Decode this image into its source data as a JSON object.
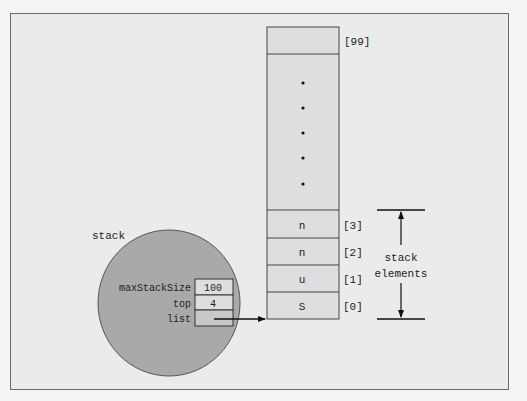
{
  "diagram": {
    "stack_object": {
      "label": "stack",
      "fields": [
        {
          "name": "maxStackSize",
          "value": "100"
        },
        {
          "name": "top",
          "value": "4"
        },
        {
          "name": "list",
          "value": ""
        }
      ]
    },
    "array": {
      "top_index_label": "[99]",
      "ellipsis_dots": 5,
      "cells": [
        {
          "index_label": "[3]",
          "value": "n"
        },
        {
          "index_label": "[2]",
          "value": "n"
        },
        {
          "index_label": "[1]",
          "value": "u"
        },
        {
          "index_label": "[0]",
          "value": "S"
        }
      ]
    },
    "annotation": {
      "line1": "stack",
      "line2": "elements"
    },
    "colors": {
      "background": "#ebebeb",
      "frame_border": "#6a6a6a",
      "array_fill": "#dedede",
      "circle_fill": "#a9a9a9",
      "stroke": "#333333"
    }
  }
}
